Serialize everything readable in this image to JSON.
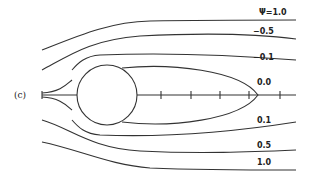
{
  "figure": {
    "panel_label": "(c)",
    "streamline_labels": {
      "psi_top": "Ψ=1.0",
      "top_05": "−0.5",
      "top_01": "−0.1",
      "zero": "0.0",
      "bot_01": "0.1",
      "bot_05": "0.5",
      "bot_10": "1.0"
    }
  }
}
